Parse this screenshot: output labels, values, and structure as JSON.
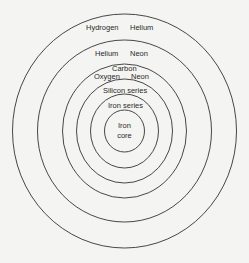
{
  "diagram": {
    "shells": [
      {
        "name": "outer-shell",
        "labels": [
          "Hydrogen",
          "Helium"
        ]
      },
      {
        "name": "second-shell",
        "labels": [
          "Helium",
          "Neon"
        ]
      },
      {
        "name": "third-shell",
        "labels": [
          "Carbon",
          "Oxygen",
          "Neon"
        ]
      },
      {
        "name": "fourth-shell",
        "labels": [
          "Silicon series"
        ]
      },
      {
        "name": "fifth-shell",
        "labels": [
          "Iron series"
        ]
      },
      {
        "name": "core",
        "labels": [
          "Iron",
          "core"
        ]
      }
    ],
    "colors": {
      "stroke": "#333333",
      "text": "#2a2a2a",
      "background": "#f4f4f2"
    }
  }
}
